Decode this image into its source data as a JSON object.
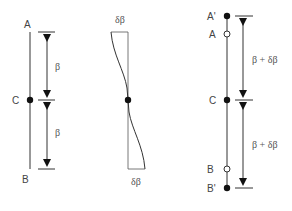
{
  "figure": {
    "left_panel": {
      "labels": {
        "top": "A",
        "center": "C",
        "bottom": "B"
      },
      "dimensions": {
        "upper": "β",
        "lower": "β"
      }
    },
    "middle_panel": {
      "labels": {
        "top": "δβ",
        "bottom": "δβ"
      }
    },
    "right_panel": {
      "labels": {
        "top_prime": "A'",
        "top": "A",
        "center": "C",
        "bottom": "B",
        "bottom_prime": "B'"
      },
      "dimensions": {
        "upper": "β + δβ",
        "lower": "β + δβ"
      }
    },
    "colors": {
      "line": "#333333",
      "text": "#444444",
      "dot": "#111111"
    }
  }
}
